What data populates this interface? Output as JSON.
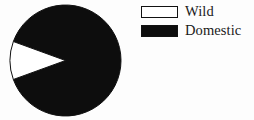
{
  "chart_data": {
    "type": "pie",
    "title": "",
    "categories": [
      "Wild",
      "Domestic"
    ],
    "values": [
      11,
      89
    ],
    "unit": "percent",
    "legend_position": "top-right",
    "grid": false,
    "slices": [
      {
        "label": "Wild",
        "value": 11,
        "fill_color": "#ffffff",
        "stroke_color": "#111111",
        "start_angle_deg": 160,
        "end_angle_deg": 200
      },
      {
        "label": "Domestic",
        "value": 89,
        "fill_color": "#0d0d0d",
        "stroke_color": "#111111",
        "start_angle_deg": 200,
        "end_angle_deg": 520
      }
    ]
  },
  "legend": {
    "items": [
      {
        "label": "Wild",
        "swatch": "white-swatch"
      },
      {
        "label": "Domestic",
        "swatch": "black-swatch"
      }
    ]
  },
  "colors": {
    "background": "#fdfdfd",
    "outline": "#111111",
    "domestic_fill": "#0d0d0d",
    "wild_fill": "#ffffff"
  }
}
